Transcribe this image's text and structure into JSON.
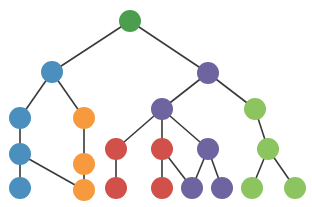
{
  "diagram": {
    "type": "tree",
    "width": 312,
    "height": 207,
    "node_radius": 11,
    "edge_color": "#3a3a3a",
    "colors": {
      "root_green": "#4a9e4e",
      "blue": "#4a8fbd",
      "orange": "#f79a3e",
      "red": "#d2504a",
      "purple": "#6d64a0",
      "light_green": "#8cc460"
    },
    "nodes": [
      {
        "id": "n0",
        "x": 130,
        "y": 21,
        "color": "root_green"
      },
      {
        "id": "n1",
        "x": 52,
        "y": 72,
        "color": "blue"
      },
      {
        "id": "n2",
        "x": 208,
        "y": 73,
        "color": "purple"
      },
      {
        "id": "n3",
        "x": 20,
        "y": 118,
        "color": "blue"
      },
      {
        "id": "n4",
        "x": 84,
        "y": 118,
        "color": "orange"
      },
      {
        "id": "n5",
        "x": 162,
        "y": 109,
        "color": "purple"
      },
      {
        "id": "n6",
        "x": 255,
        "y": 109,
        "color": "light_green"
      },
      {
        "id": "n7",
        "x": 20,
        "y": 154,
        "color": "blue"
      },
      {
        "id": "n8",
        "x": 84,
        "y": 164,
        "color": "orange"
      },
      {
        "id": "n9",
        "x": 116,
        "y": 149,
        "color": "red"
      },
      {
        "id": "n10",
        "x": 162,
        "y": 149,
        "color": "red"
      },
      {
        "id": "n11",
        "x": 208,
        "y": 149,
        "color": "purple"
      },
      {
        "id": "n12",
        "x": 268,
        "y": 149,
        "color": "light_green"
      },
      {
        "id": "n13",
        "x": 20,
        "y": 188,
        "color": "blue"
      },
      {
        "id": "n14",
        "x": 84,
        "y": 190,
        "color": "orange"
      },
      {
        "id": "n15",
        "x": 116,
        "y": 188,
        "color": "red"
      },
      {
        "id": "n16",
        "x": 162,
        "y": 188,
        "color": "red"
      },
      {
        "id": "n17",
        "x": 192,
        "y": 188,
        "color": "purple"
      },
      {
        "id": "n18",
        "x": 222,
        "y": 188,
        "color": "purple"
      },
      {
        "id": "n19",
        "x": 252,
        "y": 188,
        "color": "light_green"
      },
      {
        "id": "n20",
        "x": 295,
        "y": 188,
        "color": "light_green"
      }
    ],
    "edges": [
      [
        "n0",
        "n1"
      ],
      [
        "n0",
        "n2"
      ],
      [
        "n1",
        "n3"
      ],
      [
        "n1",
        "n4"
      ],
      [
        "n3",
        "n7"
      ],
      [
        "n7",
        "n13"
      ],
      [
        "n7",
        "n14"
      ],
      [
        "n4",
        "n8"
      ],
      [
        "n8",
        "n14"
      ],
      [
        "n2",
        "n5"
      ],
      [
        "n2",
        "n6"
      ],
      [
        "n5",
        "n9"
      ],
      [
        "n5",
        "n10"
      ],
      [
        "n5",
        "n11"
      ],
      [
        "n9",
        "n15"
      ],
      [
        "n10",
        "n16"
      ],
      [
        "n10",
        "n17"
      ],
      [
        "n11",
        "n17"
      ],
      [
        "n11",
        "n18"
      ],
      [
        "n6",
        "n12"
      ],
      [
        "n12",
        "n19"
      ],
      [
        "n12",
        "n20"
      ]
    ]
  }
}
